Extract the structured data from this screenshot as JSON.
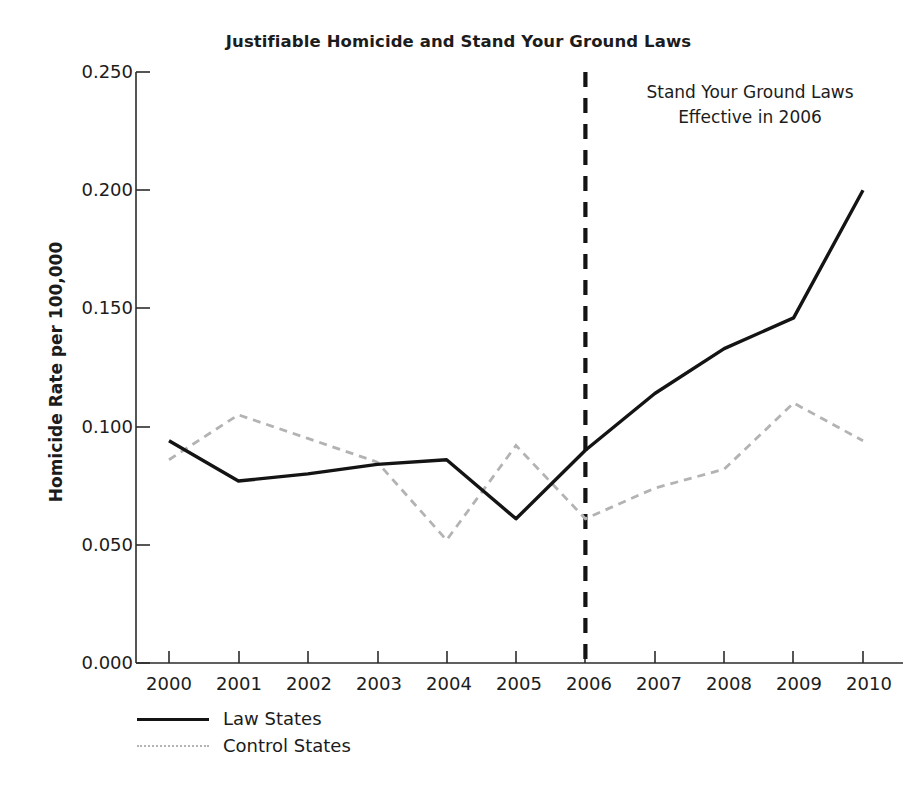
{
  "chart_data": {
    "type": "line",
    "title": "Justifiable Homicide and Stand Your Ground Laws",
    "xlabel": "",
    "ylabel": "Homicide Rate per 100,000",
    "x": [
      2000,
      2001,
      2002,
      2003,
      2004,
      2005,
      2006,
      2007,
      2008,
      2009,
      2010
    ],
    "xticklabels": [
      "2000",
      "2001",
      "2002",
      "2003",
      "2004",
      "2005",
      "2006",
      "2007",
      "2008",
      "2009",
      "2010"
    ],
    "yticklabels": [
      "0.000",
      "0.050",
      "0.100",
      "0.150",
      "0.200",
      "0.250"
    ],
    "yticks": [
      0.0,
      0.05,
      0.1,
      0.15,
      0.2,
      0.25
    ],
    "xlim": [
      2000,
      2010
    ],
    "ylim": [
      0.0,
      0.25
    ],
    "grid": false,
    "legend_position": "below-left",
    "series": [
      {
        "name": "Law States",
        "style": "solid",
        "color": "#141414",
        "values": [
          0.094,
          0.077,
          0.08,
          0.084,
          0.086,
          0.061,
          0.09,
          0.114,
          0.133,
          0.146,
          0.2
        ]
      },
      {
        "name": "Control States",
        "style": "dotted",
        "color": "#b3b3b3",
        "values": [
          0.086,
          0.105,
          0.095,
          0.085,
          0.052,
          0.092,
          0.061,
          0.074,
          0.082,
          0.11,
          0.094
        ]
      }
    ],
    "annotations": [
      {
        "name": "policy-line",
        "type": "vline",
        "x": 2006,
        "style": "dashed",
        "color": "#141414",
        "label_line1": "Stand Your Ground Laws",
        "label_line2": "Effective in 2006"
      }
    ]
  },
  "legend": {
    "items": [
      {
        "label": "Law States",
        "style": "solid"
      },
      {
        "label": "Control States",
        "style": "dotted"
      }
    ]
  }
}
